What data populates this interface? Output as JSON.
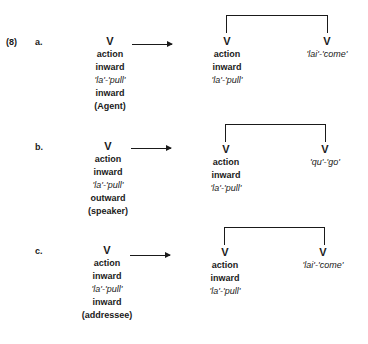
{
  "example_number": "(8)",
  "examples": [
    {
      "label": "a.",
      "source": [
        "V",
        "action",
        "inward",
        "'la'-'pull'",
        "inward",
        "(Agent)"
      ],
      "left_verb": [
        "V",
        "action",
        "inward",
        "'la'-'pull'"
      ],
      "right_verb": [
        "V",
        "'lai'-'come'"
      ]
    },
    {
      "label": "b.",
      "source": [
        "V",
        "action",
        "inward",
        "'la'-'pull'",
        "outward",
        "(speaker)"
      ],
      "left_verb": [
        "V",
        "action",
        "inward",
        "'la'-'pull'"
      ],
      "right_verb": [
        "V",
        "'qu'-'go'"
      ]
    },
    {
      "label": "c.",
      "source": [
        "V",
        "action",
        "inward",
        "'la'-'pull'",
        "inward",
        "(addressee)"
      ],
      "left_verb": [
        "V",
        "action",
        "inward",
        "'la'-'pull'"
      ],
      "right_verb": [
        "V",
        "'lai'-'come'"
      ]
    }
  ]
}
